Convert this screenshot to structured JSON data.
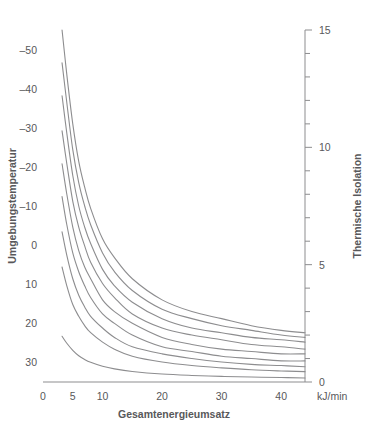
{
  "chart_data": {
    "type": "line",
    "title": "",
    "xlabel": "Gesamtenergieumsatz",
    "xunit": "kJ/min",
    "ylabel_left": "Umgebungstemperatur",
    "ylabel_right": "Thermische Isolation",
    "xlim": [
      0,
      44
    ],
    "ylim_left": [
      -55,
      35
    ],
    "ylim_right": [
      0,
      15
    ],
    "grid": false,
    "legend": "none",
    "x_ticks": [
      {
        "value": 0,
        "label": "0"
      },
      {
        "value": 5,
        "label": "5"
      },
      {
        "value": 10,
        "label": "10"
      },
      {
        "value": 20,
        "label": "20"
      },
      {
        "value": 30,
        "label": "30"
      },
      {
        "value": 40,
        "label": "40"
      }
    ],
    "y_ticks_left": [
      {
        "value": -50,
        "label": "–50"
      },
      {
        "value": -40,
        "label": "–40"
      },
      {
        "value": -30,
        "label": "–30"
      },
      {
        "value": -20,
        "label": "–20"
      },
      {
        "value": -10,
        "label": "–10"
      },
      {
        "value": 0,
        "label": "0"
      },
      {
        "value": 10,
        "label": "10"
      },
      {
        "value": 20,
        "label": "20"
      },
      {
        "value": 30,
        "label": "30"
      }
    ],
    "y_ticks_right_labeled": [
      {
        "value": 0,
        "label": "0"
      },
      {
        "value": 5,
        "label": "5"
      },
      {
        "value": 10,
        "label": "10"
      },
      {
        "value": 15,
        "label": "15"
      }
    ],
    "y_ticks_right_minor": [
      1,
      2,
      3,
      4,
      6,
      7,
      8,
      9,
      11,
      12,
      13,
      14
    ],
    "series": [
      {
        "name": "–50",
        "ambient_temp": -50,
        "x": [
          3.2,
          4,
          5,
          6,
          7,
          8,
          10,
          12,
          15,
          20,
          25,
          30,
          35,
          40,
          44
        ],
        "y": [
          15.0,
          13.1,
          11.0,
          9.4,
          8.3,
          7.4,
          6.1,
          5.3,
          4.4,
          3.5,
          3.0,
          2.7,
          2.4,
          2.2,
          2.1
        ]
      },
      {
        "name": "–40",
        "ambient_temp": -40,
        "x": [
          3.2,
          4,
          5,
          6,
          7,
          8,
          10,
          12,
          15,
          20,
          25,
          30,
          35,
          40,
          44
        ],
        "y": [
          13.6,
          11.9,
          9.9,
          8.5,
          7.5,
          6.7,
          5.5,
          4.7,
          3.9,
          3.1,
          2.7,
          2.4,
          2.2,
          2.0,
          1.9
        ]
      },
      {
        "name": "–30",
        "ambient_temp": -30,
        "x": [
          3.2,
          4,
          5,
          6,
          7,
          8,
          10,
          12,
          15,
          20,
          25,
          30,
          35,
          40,
          44
        ],
        "y": [
          12.2,
          10.6,
          8.8,
          7.5,
          6.6,
          5.9,
          4.8,
          4.1,
          3.4,
          2.7,
          2.3,
          2.1,
          1.9,
          1.8,
          1.7
        ]
      },
      {
        "name": "–20",
        "ambient_temp": -20,
        "x": [
          3.2,
          4,
          5,
          6,
          7,
          8,
          10,
          12,
          15,
          20,
          25,
          30,
          35,
          40,
          44
        ],
        "y": [
          10.7,
          9.3,
          7.7,
          6.6,
          5.8,
          5.1,
          4.2,
          3.6,
          2.9,
          2.3,
          2.0,
          1.8,
          1.6,
          1.5,
          1.4
        ]
      },
      {
        "name": "–10",
        "ambient_temp": -10,
        "x": [
          3.2,
          4,
          5,
          6,
          7,
          8,
          10,
          12,
          15,
          20,
          25,
          30,
          35,
          40,
          44
        ],
        "y": [
          9.3,
          8.0,
          6.6,
          5.6,
          4.9,
          4.4,
          3.5,
          3.0,
          2.5,
          1.9,
          1.6,
          1.4,
          1.3,
          1.2,
          1.2
        ]
      },
      {
        "name": "0",
        "ambient_temp": 0,
        "x": [
          3.2,
          4,
          5,
          6,
          7,
          8,
          10,
          12,
          15,
          20,
          25,
          30,
          35,
          40,
          44
        ],
        "y": [
          7.9,
          6.7,
          5.5,
          4.7,
          4.1,
          3.6,
          2.9,
          2.5,
          2.0,
          1.5,
          1.3,
          1.1,
          1.0,
          0.9,
          0.9
        ]
      },
      {
        "name": "10",
        "ambient_temp": 10,
        "x": [
          3.2,
          4,
          5,
          6,
          7,
          8,
          10,
          12,
          15,
          20,
          25,
          30,
          35,
          40,
          44
        ],
        "y": [
          6.4,
          5.4,
          4.4,
          3.7,
          3.2,
          2.8,
          2.3,
          1.9,
          1.5,
          1.2,
          1.0,
          0.85,
          0.75,
          0.7,
          0.65
        ]
      },
      {
        "name": "20",
        "ambient_temp": 20,
        "x": [
          3.2,
          4,
          5,
          6,
          7,
          8,
          10,
          12,
          15,
          20,
          25,
          30,
          35,
          40,
          44
        ],
        "y": [
          4.9,
          4.1,
          3.3,
          2.8,
          2.4,
          2.1,
          1.7,
          1.4,
          1.1,
          0.85,
          0.7,
          0.6,
          0.52,
          0.47,
          0.44
        ]
      },
      {
        "name": "30",
        "ambient_temp": 30,
        "x": [
          3.2,
          4,
          5,
          6,
          7,
          8,
          10,
          12,
          15,
          20,
          25,
          30,
          35,
          40,
          44
        ],
        "y": [
          1.95,
          1.65,
          1.35,
          1.12,
          0.96,
          0.84,
          0.67,
          0.56,
          0.45,
          0.34,
          0.28,
          0.24,
          0.21,
          0.19,
          0.17
        ]
      }
    ]
  },
  "colors": {
    "axis": "#8d8d8f",
    "curve": "#8d8d8f",
    "text": "#58585a",
    "background": "#ffffff"
  }
}
